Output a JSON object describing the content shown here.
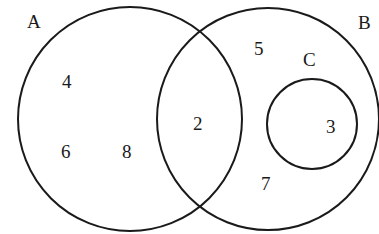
{
  "diagram": {
    "type": "venn",
    "sets": [
      {
        "name": "A",
        "label": "A",
        "cx": 130,
        "cy": 119,
        "r": 112,
        "label_x": 27,
        "label_y": 28
      },
      {
        "name": "B",
        "label": "B",
        "cx": 268,
        "cy": 119,
        "r": 111,
        "label_x": 358,
        "label_y": 29
      },
      {
        "name": "C",
        "label": "C",
        "cx": 312,
        "cy": 124,
        "r": 45,
        "label_x": 303,
        "label_y": 66
      }
    ],
    "elements": [
      {
        "value": "4",
        "region": "A only",
        "x": 62,
        "y": 88
      },
      {
        "value": "6",
        "region": "A only",
        "x": 61,
        "y": 158
      },
      {
        "value": "8",
        "region": "A only",
        "x": 122,
        "y": 158
      },
      {
        "value": "2",
        "region": "A ∩ B",
        "x": 193,
        "y": 130
      },
      {
        "value": "5",
        "region": "B only",
        "x": 254,
        "y": 55
      },
      {
        "value": "7",
        "region": "B only",
        "x": 261,
        "y": 190
      },
      {
        "value": "3",
        "region": "C",
        "x": 326,
        "y": 133
      }
    ],
    "stroke_color": "#1a1a1a",
    "background": "#ffffff"
  }
}
